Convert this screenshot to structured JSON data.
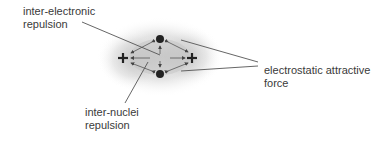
{
  "labels": {
    "inter_electronic": [
      "inter-electronic",
      "repulsion"
    ],
    "electrostatic": [
      "electrostatic attractive",
      "force"
    ],
    "inter_nuclei": [
      "inter-nuclei",
      "repulsion"
    ]
  },
  "diagram": {
    "electrons": [
      {
        "id": "top",
        "x": 160,
        "y": 39
      },
      {
        "id": "bottom",
        "x": 160,
        "y": 74
      }
    ],
    "nuclei": [
      {
        "id": "left",
        "x": 123,
        "y": 58,
        "symbol": "+"
      },
      {
        "id": "right",
        "x": 192,
        "y": 58,
        "symbol": "+"
      }
    ],
    "colors": {
      "text": "#3a3a3a",
      "line": "#555555",
      "particle": "#222222",
      "cloud": "#bdbdbd"
    }
  }
}
